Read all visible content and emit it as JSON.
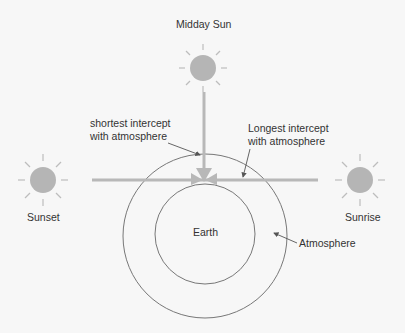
{
  "labels": {
    "midday_sun": "Midday Sun",
    "sunset": "Sunset",
    "sunrise": "Sunrise",
    "earth": "Earth",
    "atmosphere": "Atmosphere",
    "shortest_line1": "shortest intercept",
    "shortest_line2": "with atmosphere",
    "longest_line1": "Longest intercept",
    "longest_line2": "with atmosphere"
  },
  "colors": {
    "background": "#f7f7f7",
    "sun_fill": "#b5b5b5",
    "ray": "#bdbdbd",
    "beam": "#b8b8b8",
    "circle_stroke": "#777777",
    "arrow": "#555555",
    "text": "#333333"
  }
}
